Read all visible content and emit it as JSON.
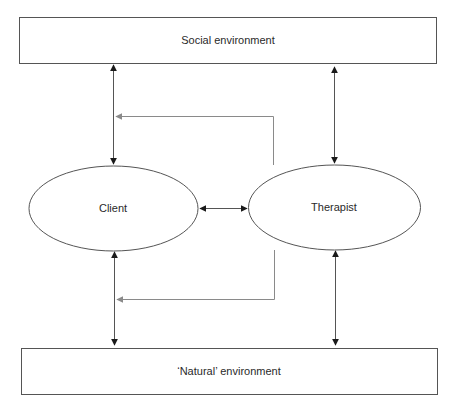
{
  "diagram": {
    "nodes": {
      "social": {
        "label": "Social environment"
      },
      "client": {
        "label": "Client"
      },
      "therapist": {
        "label": "Therapist"
      },
      "natural": {
        "label": "‘Natural’ environment"
      }
    },
    "edges": [
      {
        "from": "client",
        "to": "social",
        "type": "bidirectional"
      },
      {
        "from": "therapist",
        "to": "social",
        "type": "bidirectional"
      },
      {
        "from": "client",
        "to": "therapist",
        "type": "bidirectional"
      },
      {
        "from": "client",
        "to": "natural",
        "type": "bidirectional"
      },
      {
        "from": "therapist",
        "to": "natural",
        "type": "bidirectional"
      },
      {
        "from": "therapist",
        "to": "client-social-link",
        "type": "feedback",
        "color": "#8a8a8a"
      },
      {
        "from": "therapist",
        "to": "client-natural-link",
        "type": "feedback",
        "color": "#8a8a8a"
      }
    ],
    "colors": {
      "line": "#555555",
      "arrow": "#1a1a1a",
      "feedback": "#8a8a8a"
    }
  }
}
